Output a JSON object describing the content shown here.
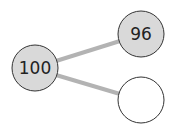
{
  "diagram": {
    "type": "number-bond",
    "colors": {
      "filled": "#d9d9d9",
      "empty": "#ffffff",
      "stroke": "#333333",
      "connector": "#b3b3b3"
    },
    "whole": {
      "label": "100"
    },
    "parts": [
      {
        "label": "96"
      },
      {
        "label": ""
      }
    ]
  }
}
